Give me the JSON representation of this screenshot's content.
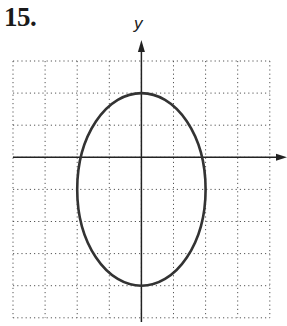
{
  "problem": {
    "number": "15."
  },
  "chart_data": {
    "type": "line",
    "title": "15.",
    "xlabel": "",
    "ylabel": "y",
    "grid": true,
    "grid_style": "dotted",
    "xlim": [
      -4,
      4
    ],
    "ylim": [
      -5,
      3
    ],
    "grid_step": 1,
    "series": [
      {
        "name": "ellipse",
        "shape": "ellipse",
        "center": [
          0,
          -1
        ],
        "semi_axis_x": 2,
        "semi_axis_y": 3,
        "equation": "x^2/4 + (y+1)^2/9 = 1",
        "vertices": [
          [
            0,
            2
          ],
          [
            0,
            -4
          ]
        ],
        "co_vertices": [
          [
            -2,
            -1
          ],
          [
            2,
            -1
          ]
        ]
      }
    ]
  },
  "colors": {
    "curve": "#333333",
    "axis": "#222222",
    "grid": "#555555"
  }
}
